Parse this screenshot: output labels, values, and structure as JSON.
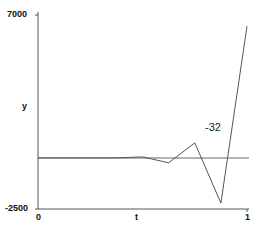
{
  "chart_data": {
    "type": "line",
    "title": "",
    "xlabel": "t",
    "ylabel": "y",
    "xlim": [
      0,
      1
    ],
    "ylim": [
      -2500,
      7000
    ],
    "x_ticks": [
      "0",
      "1"
    ],
    "y_ticks": [
      "-2500",
      "7000"
    ],
    "grid": false,
    "series": [
      {
        "name": "y",
        "x": [
          0,
          0.125,
          0.25,
          0.375,
          0.5,
          0.625,
          0.75,
          0.875,
          1.0
        ],
        "y": [
          0,
          0,
          0,
          0,
          50,
          -240,
          735,
          -2210,
          6450
        ],
        "color": "#555555"
      },
      {
        "name": "reference",
        "x": [
          0,
          1.0
        ],
        "y": [
          -32,
          -32
        ],
        "color": "#555555"
      }
    ],
    "annotations": [
      {
        "text": "-32",
        "x": 0.8,
        "y": 600
      }
    ]
  },
  "axes": {
    "y_top_label": "7000",
    "y_bottom_label": "-2500",
    "y_axis_label": "y",
    "x_left_label": "0",
    "x_mid_label": "t",
    "x_right_label": "1"
  },
  "annotation": {
    "value_label": "-32"
  }
}
